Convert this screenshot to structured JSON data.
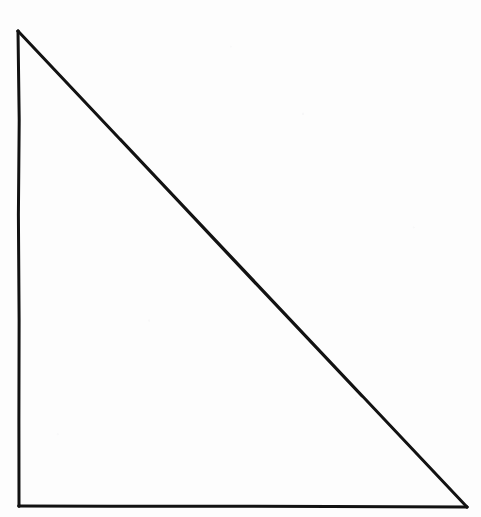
{
  "figure": {
    "title": "Right triangle outline",
    "kind": "line-drawing",
    "shape_name": "right-triangle",
    "filled": false,
    "background_color": "#fdfdfd",
    "stroke_color": "#121212",
    "stroke_width": 3,
    "canvas": {
      "width": 481,
      "height": 517
    },
    "vertices": [
      {
        "name": "apex-top-left",
        "x": 18,
        "y": 31,
        "angle_label": ""
      },
      {
        "name": "right-angle-bottom-left",
        "x": 19,
        "y": 506,
        "angle_label": ""
      },
      {
        "name": "bottom-right",
        "x": 467,
        "y": 507,
        "angle_label": ""
      }
    ],
    "edges": [
      {
        "name": "vertical-leg",
        "from": "apex-top-left",
        "to": "right-angle-bottom-left"
      },
      {
        "name": "horizontal-leg",
        "from": "right-angle-bottom-left",
        "to": "bottom-right"
      },
      {
        "name": "hypotenuse",
        "from": "bottom-right",
        "to": "apex-top-left"
      }
    ],
    "path_points": "18,31 19.5,140 18.5,250 19,380 19,506 140,506.5 300,506.5 467,507 360,394 240,267 120,142",
    "labels": [],
    "annotations": []
  }
}
